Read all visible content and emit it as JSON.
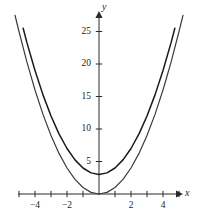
{
  "chart_data": {
    "type": "line",
    "title": "",
    "subtitle": "",
    "xlabel": "x",
    "ylabel": "y",
    "xlim": [
      -5.4,
      5.4
    ],
    "ylim": [
      -1.6,
      27.5
    ],
    "grid": false,
    "legend": "none",
    "x_ticks": [
      -5,
      -4,
      -3,
      -2,
      -1,
      1,
      2,
      3,
      4,
      5
    ],
    "x_tick_labels": [
      "",
      "−4",
      "",
      "−2",
      "",
      "",
      "2",
      "",
      "4",
      ""
    ],
    "y_ticks": [
      5,
      10,
      15,
      20,
      25
    ],
    "y_tick_labels": [
      "5",
      "10",
      "15",
      "20",
      "25"
    ],
    "axis_arrows": {
      "x": "right",
      "y": "up"
    },
    "series": [
      {
        "name": "y = x^2 + 3",
        "style": "solid",
        "color": "#1a1a1a",
        "width": 1.5,
        "vertex": [
          0,
          3
        ],
        "points": [
          [
            -4.74,
            25.5
          ],
          [
            -4.5,
            23.25
          ],
          [
            -4.0,
            19.0
          ],
          [
            -3.5,
            15.25
          ],
          [
            -3.0,
            12.0
          ],
          [
            -2.5,
            9.25
          ],
          [
            -2.0,
            7.0
          ],
          [
            -1.5,
            5.25
          ],
          [
            -1.0,
            4.0
          ],
          [
            -0.5,
            3.25
          ],
          [
            0.0,
            3.0
          ],
          [
            0.5,
            3.25
          ],
          [
            1.0,
            4.0
          ],
          [
            1.5,
            5.25
          ],
          [
            2.0,
            7.0
          ],
          [
            2.5,
            9.25
          ],
          [
            3.0,
            12.0
          ],
          [
            3.5,
            15.25
          ],
          [
            4.0,
            19.0
          ],
          [
            4.5,
            23.25
          ],
          [
            4.74,
            25.5
          ]
        ]
      },
      {
        "name": "y = x^2",
        "style": "solid",
        "color": "#3b3b3b",
        "width": 1.2,
        "vertex": [
          0,
          0
        ],
        "points": [
          [
            -5.25,
            27.5
          ],
          [
            -5.0,
            25.0
          ],
          [
            -4.5,
            20.25
          ],
          [
            -4.0,
            16.0
          ],
          [
            -3.5,
            12.25
          ],
          [
            -3.0,
            9.0
          ],
          [
            -2.5,
            6.25
          ],
          [
            -2.0,
            4.0
          ],
          [
            -1.5,
            2.25
          ],
          [
            -1.0,
            1.0
          ],
          [
            -0.5,
            0.25
          ],
          [
            0.0,
            0.0
          ],
          [
            0.5,
            0.25
          ],
          [
            1.0,
            1.0
          ],
          [
            1.5,
            2.25
          ],
          [
            2.0,
            4.0
          ],
          [
            2.5,
            6.25
          ],
          [
            3.0,
            9.0
          ],
          [
            3.5,
            12.25
          ],
          [
            4.0,
            16.0
          ],
          [
            4.5,
            20.25
          ],
          [
            5.0,
            25.0
          ],
          [
            5.25,
            27.5
          ]
        ]
      }
    ]
  }
}
